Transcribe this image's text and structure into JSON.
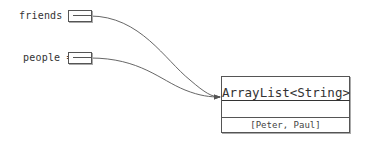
{
  "variables": [
    {
      "name": "friends",
      "label": "friends ="
    },
    {
      "name": "people",
      "label": "people ="
    }
  ],
  "object": {
    "type": "ArrayList<String>",
    "value": "[Peter, Paul]"
  }
}
